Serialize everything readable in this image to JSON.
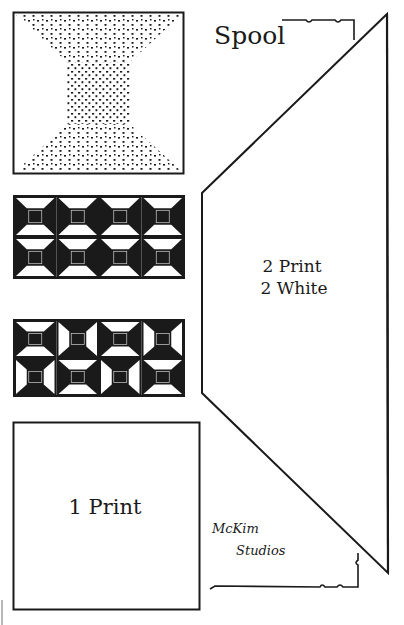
{
  "document": {
    "title": "Spool",
    "kind": "quilt pattern template sheet"
  },
  "templates": {
    "large_piece": {
      "name": "spool-side-trapezoid",
      "cut_line1": "2 Print",
      "cut_line2": "2 White"
    },
    "center_square": {
      "name": "spool-center-square",
      "cut_label": "1 Print"
    }
  },
  "illustrations": {
    "spool_block": "single spool block, stippled print",
    "layout_a": {
      "rows": 2,
      "cols": 4,
      "arrangement": "all spools horizontal"
    },
    "layout_b": {
      "rows": 2,
      "cols": 4,
      "arrangement": "alternating horizontal / vertical spools"
    }
  },
  "signature": {
    "line1": "McKim",
    "line2": "Studios"
  },
  "colors": {
    "ink": "#1a1a1a",
    "paper": "#ffffff"
  }
}
